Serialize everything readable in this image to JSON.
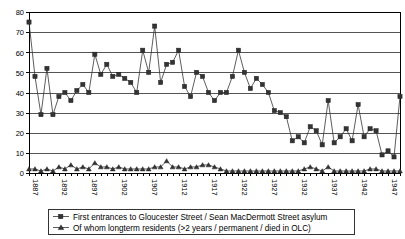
{
  "chart_data": {
    "type": "line",
    "title": "",
    "xlabel": "",
    "ylabel": "",
    "ylim": [
      0,
      80
    ],
    "ytick_values": [
      0,
      10,
      20,
      30,
      40,
      50,
      60,
      70,
      80
    ],
    "grid": true,
    "legend_position": "bottom",
    "x": [
      1887,
      1888,
      1889,
      1890,
      1891,
      1892,
      1893,
      1894,
      1895,
      1896,
      1897,
      1898,
      1899,
      1900,
      1901,
      1902,
      1903,
      1904,
      1905,
      1906,
      1907,
      1908,
      1909,
      1910,
      1911,
      1912,
      1913,
      1914,
      1915,
      1916,
      1917,
      1918,
      1919,
      1920,
      1921,
      1922,
      1923,
      1924,
      1925,
      1926,
      1927,
      1928,
      1929,
      1930,
      1931,
      1932,
      1933,
      1934,
      1935,
      1936,
      1937,
      1938,
      1939,
      1940,
      1941,
      1942,
      1943,
      1944,
      1945,
      1946,
      1947,
      1948,
      1949
    ],
    "xtick_labels": [
      "1887",
      "1892",
      "1897",
      "1902",
      "1907",
      "1912",
      "1917",
      "1922",
      "1927",
      "1932",
      "1937",
      "1942",
      "1947"
    ],
    "series": [
      {
        "name": "First entrances to Gloucester Street / Sean MacDermott Street asylum",
        "marker": "square",
        "values": [
          75,
          48,
          29,
          52,
          29,
          38,
          40,
          36,
          41,
          44,
          40,
          59,
          49,
          54,
          48,
          49,
          47,
          45,
          40,
          61,
          50,
          73,
          45,
          54,
          55,
          61,
          43,
          38,
          50,
          48,
          40,
          36,
          40,
          40,
          48,
          61,
          50,
          42,
          47,
          44,
          40,
          31,
          30,
          28,
          16,
          18,
          15,
          23,
          21,
          14,
          36,
          15,
          18,
          22,
          16,
          34,
          18,
          22,
          21,
          9,
          11,
          8,
          38
        ]
      },
      {
        "name": "Of whom longterm residents (>2 years / permanent / died in OLC)",
        "marker": "triangle",
        "values": [
          2,
          2,
          1,
          2,
          1,
          3,
          2,
          4,
          2,
          3,
          2,
          5,
          3,
          3,
          2,
          3,
          2,
          2,
          2,
          2,
          2,
          3,
          3,
          6,
          3,
          3,
          2,
          3,
          3,
          4,
          4,
          3,
          2,
          1,
          1,
          1,
          1,
          1,
          1,
          1,
          1,
          1,
          1,
          1,
          1,
          1,
          2,
          3,
          2,
          1,
          3,
          1,
          1,
          1,
          1,
          1,
          1,
          2,
          2,
          1,
          1,
          1,
          1
        ]
      }
    ]
  },
  "legend": {
    "items": [
      {
        "label": "First entrances to Gloucester Street / Sean MacDermott Street asylum",
        "marker": "square"
      },
      {
        "label": "Of whom longterm residents (>2 years / permanent / died in OLC)",
        "marker": "triangle"
      }
    ]
  }
}
